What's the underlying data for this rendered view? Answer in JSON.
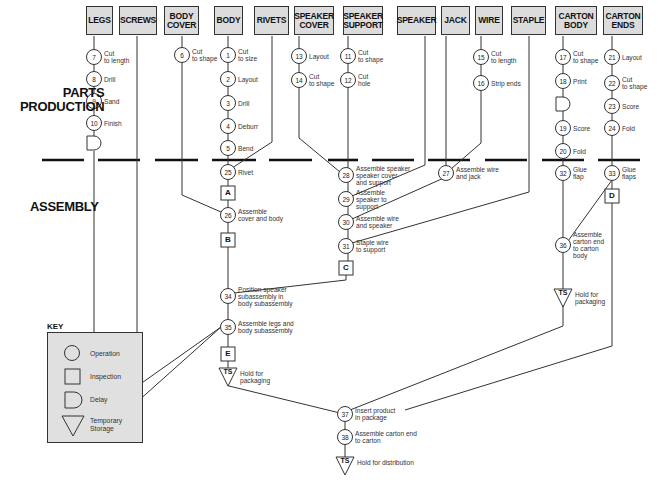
{
  "sections": {
    "parts_production": "PARTS\nPRODUCTION",
    "assembly": "ASSEMBLY"
  },
  "headers": [
    {
      "id": "legs",
      "label": "LEGS",
      "x": 86,
      "w": 27
    },
    {
      "id": "screws",
      "label": "SCREWS",
      "x": 119,
      "w": 38
    },
    {
      "id": "body_cover",
      "label": "BODY\nCOVER",
      "x": 164,
      "w": 35
    },
    {
      "id": "body",
      "label": "BODY",
      "x": 214,
      "w": 29
    },
    {
      "id": "rivets",
      "label": "RIVETS",
      "x": 254,
      "w": 35
    },
    {
      "id": "speaker_cover",
      "label": "SPEAKER\nCOVER",
      "x": 294,
      "w": 40
    },
    {
      "id": "speaker_support",
      "label": "SPEAKER\nSUPPORT",
      "x": 343,
      "w": 40
    },
    {
      "id": "speaker",
      "label": "SPEAKER",
      "x": 397,
      "w": 39
    },
    {
      "id": "jack",
      "label": "JACK",
      "x": 441,
      "w": 29
    },
    {
      "id": "wire",
      "label": "WIRE",
      "x": 475,
      "w": 28
    },
    {
      "id": "staple",
      "label": "STAPLE",
      "x": 511,
      "w": 35
    },
    {
      "id": "carton_body",
      "label": "CARTON\nBODY",
      "x": 555,
      "w": 42
    },
    {
      "id": "carton_ends",
      "label": "CARTON\nENDS",
      "x": 603,
      "w": 40
    }
  ],
  "operations": [
    {
      "n": "7",
      "x": 94,
      "y": 57,
      "label": "Cut\nto length"
    },
    {
      "n": "8",
      "x": 94,
      "y": 79,
      "label": "Drill"
    },
    {
      "n": "9",
      "x": 94,
      "y": 101,
      "label": "Sand"
    },
    {
      "n": "10",
      "x": 94,
      "y": 123,
      "label": "Finish"
    },
    {
      "n": "6",
      "x": 182,
      "y": 55,
      "label": "Cut\nto shape"
    },
    {
      "n": "1",
      "x": 228,
      "y": 55,
      "label": "Cut\nto size"
    },
    {
      "n": "2",
      "x": 228,
      "y": 79,
      "label": "Layout"
    },
    {
      "n": "3",
      "x": 228,
      "y": 103,
      "label": "Drill"
    },
    {
      "n": "4",
      "x": 228,
      "y": 126,
      "label": "Deburr"
    },
    {
      "n": "5",
      "x": 228,
      "y": 148,
      "label": "Bend"
    },
    {
      "n": "13",
      "x": 299,
      "y": 56,
      "label": "Layout"
    },
    {
      "n": "14",
      "x": 299,
      "y": 80,
      "label": "Cut\nto shape"
    },
    {
      "n": "11",
      "x": 348,
      "y": 56,
      "label": "Cut\nto shape"
    },
    {
      "n": "12",
      "x": 348,
      "y": 80,
      "label": "Cut\nhole"
    },
    {
      "n": "15",
      "x": 481,
      "y": 57,
      "label": "Cut\nto length"
    },
    {
      "n": "16",
      "x": 481,
      "y": 83,
      "label": "Strip ends"
    },
    {
      "n": "17",
      "x": 563,
      "y": 57,
      "label": "Cut\nto shape"
    },
    {
      "n": "18",
      "x": 563,
      "y": 81,
      "label": "Print"
    },
    {
      "n": "19",
      "x": 563,
      "y": 128,
      "label": "Score"
    },
    {
      "n": "20",
      "x": 563,
      "y": 151,
      "label": "Fold"
    },
    {
      "n": "21",
      "x": 612,
      "y": 57,
      "label": "Layout"
    },
    {
      "n": "22",
      "x": 612,
      "y": 83,
      "label": "Cut\nto shape"
    },
    {
      "n": "23",
      "x": 612,
      "y": 106,
      "label": "Score"
    },
    {
      "n": "24",
      "x": 612,
      "y": 128,
      "label": "Fold"
    },
    {
      "n": "25",
      "x": 228,
      "y": 172,
      "label": "Rivet"
    },
    {
      "n": "26",
      "x": 228,
      "y": 215,
      "label": "Assemble\ncover and body"
    },
    {
      "n": "28",
      "x": 346,
      "y": 175,
      "label": "Assemble speaker\nspeaker cover\nand support"
    },
    {
      "n": "29",
      "x": 346,
      "y": 199,
      "label": "Assemble\nspeaker to\nsupport"
    },
    {
      "n": "30",
      "x": 346,
      "y": 222,
      "label": "Assemble wire\nand speaker"
    },
    {
      "n": "31",
      "x": 346,
      "y": 246,
      "label": "Staple wire\nto support"
    },
    {
      "n": "27",
      "x": 446,
      "y": 173,
      "label": "Assemble wire\nand jack"
    },
    {
      "n": "32",
      "x": 563,
      "y": 173,
      "label": "Glue\nflap"
    },
    {
      "n": "33",
      "x": 612,
      "y": 173,
      "label": "Glue\nflaps"
    },
    {
      "n": "36",
      "x": 563,
      "y": 245,
      "label": "Assemble\ncarton end\nto carton\nbody"
    },
    {
      "n": "34",
      "x": 228,
      "y": 296,
      "label": "Position speaker\nsubassembly in\nbody subassembly"
    },
    {
      "n": "35",
      "x": 228,
      "y": 327,
      "label": "Assemble legs and\nbody subassembly"
    },
    {
      "n": "37",
      "x": 345,
      "y": 414,
      "label": "Insert product\nin package"
    },
    {
      "n": "38",
      "x": 345,
      "y": 437,
      "label": "Assemble carton end\nto carton"
    }
  ],
  "inspections": [
    {
      "letter": "A",
      "x": 228,
      "y": 193
    },
    {
      "letter": "B",
      "x": 228,
      "y": 240
    },
    {
      "letter": "C",
      "x": 346,
      "y": 268
    },
    {
      "letter": "D",
      "x": 612,
      "y": 196
    },
    {
      "letter": "E",
      "x": 228,
      "y": 354
    }
  ],
  "delays": [
    {
      "x": 94,
      "y": 143
    },
    {
      "x": 563,
      "y": 104
    }
  ],
  "storages": [
    {
      "x": 563,
      "y": 297,
      "code": "TS",
      "label": "Hold for\npackaging"
    },
    {
      "x": 228,
      "y": 376,
      "code": "TS",
      "label": "Hold for\npackaging"
    },
    {
      "x": 345,
      "y": 465,
      "code": "TS",
      "label": "Hold for distribution"
    }
  ],
  "key": {
    "title": "KEY",
    "items": [
      {
        "shape": "operation",
        "label": "Operation"
      },
      {
        "shape": "inspection",
        "label": "Inspection"
      },
      {
        "shape": "delay",
        "label": "Delay"
      },
      {
        "shape": "storage",
        "label": "Temporary\nStorage"
      }
    ]
  },
  "colors": {
    "header_fill": "#dcdcdc",
    "key_fill": "#e0e0e0",
    "line": "#333333"
  }
}
